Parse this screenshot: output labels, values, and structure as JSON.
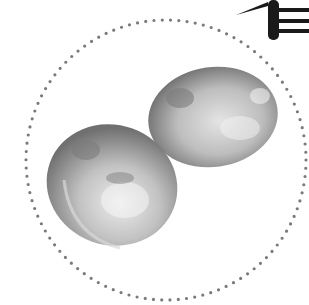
{
  "image": {
    "description": "Grayscale photo of two potatoes inside a dotted circular frame, with a partial black calligraphic brush stroke character at the top-right corner",
    "colors": {
      "background": "#ffffff",
      "dots": "#7a7a7a",
      "stroke": "#1a1a1a",
      "potato_light": "#d6d6d6",
      "potato_mid": "#a8a8a8",
      "potato_dark": "#5c5c5c"
    },
    "frame": {
      "shape": "dotted-circle",
      "cx": 166,
      "cy": 160,
      "r": 140
    },
    "objects": [
      {
        "name": "potato",
        "position": "upper-right"
      },
      {
        "name": "potato",
        "position": "lower-left"
      }
    ]
  }
}
